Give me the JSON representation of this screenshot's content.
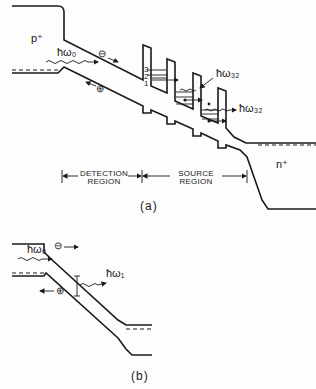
{
  "figure_a": {
    "region_p": "p⁺",
    "region_n": "n⁺",
    "photon_in": "ħω₀",
    "photon_out_1": "ħω₃₂",
    "photon_out_2": "ħω₃₂",
    "electron": "⊖",
    "hole": "⊕",
    "levels": [
      "3",
      "2",
      "1"
    ],
    "detection_region": "DETECTION REGION",
    "detection_line1": "DETECTION",
    "detection_line2": "REGION",
    "source_line1": "SOURCE",
    "source_line2": "REGION",
    "caption": "(a)"
  },
  "figure_b": {
    "photon_in": "ħω₀",
    "photon_out": "ħω₁",
    "electron": "⊖",
    "hole": "⊕",
    "caption": "(b)"
  }
}
